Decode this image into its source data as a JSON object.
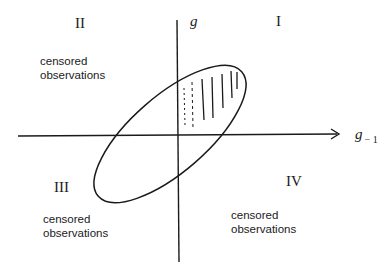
{
  "diagram": {
    "axes": {
      "vertical_label": "g",
      "horizontal_label": "g",
      "horizontal_subscript": "− 1"
    },
    "quadrants": [
      {
        "id": "I",
        "label": "I",
        "note": null
      },
      {
        "id": "II",
        "label": "II",
        "note_line1": "censored",
        "note_line2": "observations"
      },
      {
        "id": "III",
        "label": "III",
        "note_line1": "censored",
        "note_line2": "observations"
      },
      {
        "id": "IV",
        "label": "IV",
        "note_line1": "censored",
        "note_line2": "observations"
      }
    ],
    "shape": "tilted ellipse with shaded region in quadrant I",
    "colors": {
      "ink": "#1a1a1a",
      "background": "#ffffff"
    }
  }
}
